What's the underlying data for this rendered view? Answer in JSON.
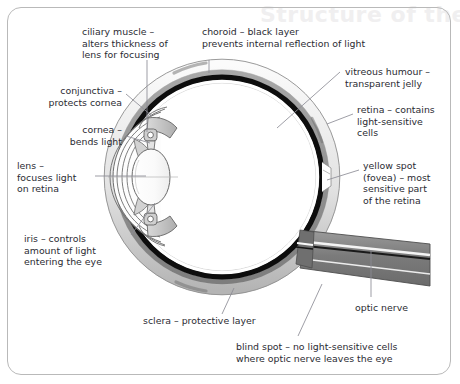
{
  "diagram": {
    "watermark_text": "Structure of the eye",
    "background_color": "#ffffff",
    "frame_color": "#b9b9b9",
    "text_color": "#2b2b33",
    "leader_color": "#8c8c96",
    "palette": {
      "sclera": "#f2f2f2",
      "sclera_mid": "#9a9a9a",
      "choroid": "#111111",
      "retina": "#ffffff",
      "vitreous": "#ffffff",
      "ciliary": "#c9c9c9",
      "lens": "#fcfcfc",
      "optic_nerve": "#7c7c7c",
      "outline": "#555555"
    },
    "labels": [
      {
        "name": "ciliary-muscle",
        "text": "ciliary muscle –\nalters thickness of\nlens for focusing",
        "x": 82,
        "y": 26,
        "width": 130,
        "align": "left"
      },
      {
        "name": "choroid",
        "text": "choroid – black layer\nprevents internal reflection of light",
        "x": 202,
        "y": 26,
        "width": 220,
        "align": "left"
      },
      {
        "name": "vitreous-humour",
        "text": "vitreous humour –\ntransparent jelly",
        "x": 345,
        "y": 66,
        "width": 110,
        "align": "left"
      },
      {
        "name": "conjunctiva",
        "text": "conjunctiva –\nprotects cornea",
        "x": 30,
        "y": 85,
        "width": 92,
        "align": "right"
      },
      {
        "name": "retina",
        "text": "retina – contains\nlight-sensitive\ncells",
        "x": 357,
        "y": 104,
        "width": 100,
        "align": "left"
      },
      {
        "name": "cornea",
        "text": "cornea –\nbends light",
        "x": 30,
        "y": 124,
        "width": 92,
        "align": "right"
      },
      {
        "name": "lens",
        "text": "lens –\nfocuses light\non retina",
        "x": 17,
        "y": 160,
        "width": 92,
        "align": "left"
      },
      {
        "name": "yellow-spot-fovea",
        "text": "yellow spot\n(fovea) – most\nsensitive part\nof the retina",
        "x": 363,
        "y": 160,
        "width": 96,
        "align": "left"
      },
      {
        "name": "iris",
        "text": "iris – controls\namount of light\nentering the eye",
        "x": 24,
        "y": 233,
        "width": 104,
        "align": "left"
      },
      {
        "name": "optic-nerve",
        "text": "optic nerve",
        "x": 355,
        "y": 302,
        "width": 80,
        "align": "left"
      },
      {
        "name": "sclera",
        "text": "sclera – protective layer",
        "x": 143,
        "y": 315,
        "width": 130,
        "align": "left"
      },
      {
        "name": "blind-spot",
        "text": "blind spot – no light-sensitive cells\nwhere optic nerve leaves the eye",
        "x": 236,
        "y": 341,
        "width": 215,
        "align": "left"
      }
    ],
    "leader_lines": [
      {
        "name": "leader-ciliary-muscle",
        "x1": 147,
        "y1": 60,
        "x2": 147,
        "y2": 132
      },
      {
        "name": "leader-choroid",
        "x1": 209,
        "y1": 60,
        "x2": 209,
        "y2": 73
      },
      {
        "name": "leader-vitreous-humour",
        "x1": 340,
        "y1": 72,
        "x2": 277,
        "y2": 128
      },
      {
        "name": "leader-conjunctiva",
        "x1": 126,
        "y1": 94,
        "x2": 152,
        "y2": 116
      },
      {
        "name": "leader-retina",
        "x1": 353,
        "y1": 114,
        "x2": 327,
        "y2": 124
      },
      {
        "name": "leader-cornea",
        "x1": 126,
        "y1": 136,
        "x2": 150,
        "y2": 143
      },
      {
        "name": "leader-lens",
        "x1": 95,
        "y1": 176,
        "x2": 146,
        "y2": 176
      },
      {
        "name": "leader-yellow-spot",
        "x1": 359,
        "y1": 170,
        "x2": 327,
        "y2": 180
      },
      {
        "name": "leader-iris",
        "x1": 131,
        "y1": 235,
        "x2": 155,
        "y2": 203
      },
      {
        "name": "leader-optic-nerve",
        "x1": 371,
        "y1": 297,
        "x2": 371,
        "y2": 250
      },
      {
        "name": "leader-sclera",
        "x1": 222,
        "y1": 314,
        "x2": 234,
        "y2": 288
      },
      {
        "name": "leader-blind-spot",
        "x1": 298,
        "y1": 336,
        "x2": 322,
        "y2": 284
      }
    ]
  }
}
